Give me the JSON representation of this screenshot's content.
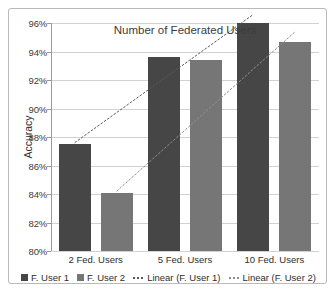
{
  "chart_data": {
    "type": "bar",
    "title": "Number of Federated Users",
    "xlabel": "",
    "ylabel": "Accuracy",
    "categories": [
      "2 Fed. Users",
      "5 Fed. Users",
      "10 Fed. Users"
    ],
    "ylim": [
      80,
      96
    ],
    "y_tick_labels": [
      "80%",
      "82%",
      "84%",
      "86%",
      "88%",
      "90%",
      "92%",
      "94%",
      "96%"
    ],
    "y_tick_values": [
      80,
      82,
      84,
      86,
      88,
      90,
      92,
      94,
      96
    ],
    "grid": true,
    "legend_position": "bottom",
    "series": [
      {
        "name": "F. User 1",
        "type": "bar",
        "color": "#464646",
        "values": [
          87.5,
          93.6,
          96.0
        ]
      },
      {
        "name": "F. User 2",
        "type": "bar",
        "color": "#767676",
        "values": [
          84.1,
          93.4,
          94.7
        ]
      },
      {
        "name": "Linear (F. User 1)",
        "type": "trendline",
        "color": "#595959",
        "endpoints": [
          87.6,
          96.6
        ]
      },
      {
        "name": "Linear (F. User 2)",
        "type": "trendline",
        "color": "#909090",
        "endpoints": [
          84.2,
          95.4
        ]
      }
    ]
  },
  "legend": {
    "items": [
      {
        "label": "F. User 1",
        "marker": "square",
        "color": "#464646"
      },
      {
        "label": "F. User 2",
        "marker": "square",
        "color": "#767676"
      },
      {
        "label": "Linear (F. User 1)",
        "marker": "dotted-line",
        "color": "#595959"
      },
      {
        "label": "Linear (F. User 2)",
        "marker": "dotted-line",
        "color": "#909090"
      }
    ]
  }
}
